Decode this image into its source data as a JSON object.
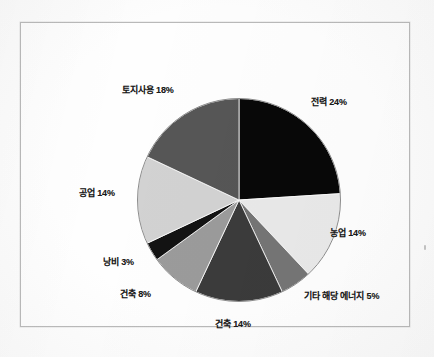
{
  "figure": {
    "frame_border_color": "#b9b9b9",
    "background_color": "#fdfdfd"
  },
  "chart_data": {
    "type": "pie",
    "title": "",
    "subtitle": "",
    "xlabel": "",
    "ylabel": "",
    "legend_position": "none",
    "grid": false,
    "label_format": "{name} {value}%",
    "start_angle_deg": 0,
    "direction": "clockwise",
    "total": 100,
    "categories": [
      "전력",
      "농업",
      "기타 해당 에너지",
      "건축",
      "건축",
      "낭비",
      "공업",
      "토지사용"
    ],
    "values": [
      24,
      14,
      5,
      14,
      8,
      3,
      14,
      18
    ],
    "colors": [
      "#080808",
      "#e9e9e9",
      "#757575",
      "#3b3b3b",
      "#9b9b9b",
      "#131313",
      "#d2d2d2",
      "#565656"
    ],
    "slices": [
      {
        "name": "전력",
        "value": 24,
        "label": "전력 24%",
        "color": "#080808"
      },
      {
        "name": "농업",
        "value": 14,
        "label": "농업 14%",
        "color": "#e9e9e9"
      },
      {
        "name": "기타 해당 에너지",
        "value": 5,
        "label": "기타 해당 에너지 5%",
        "color": "#757575"
      },
      {
        "name": "건축",
        "value": 14,
        "label": "건축 14%",
        "color": "#3b3b3b"
      },
      {
        "name": "건축",
        "value": 8,
        "label": "건축 8%",
        "color": "#9b9b9b"
      },
      {
        "name": "낭비",
        "value": 3,
        "label": "낭비 3%",
        "color": "#131313"
      },
      {
        "name": "공업",
        "value": 14,
        "label": "공업 14%",
        "color": "#d2d2d2"
      },
      {
        "name": "토지사용",
        "value": 18,
        "label": "토지사용 18%",
        "color": "#565656"
      }
    ]
  },
  "labels": {
    "power": "전력 24%",
    "agriculture": "농업 14%",
    "other_energy": "기타 해당 에너지 5%",
    "building_14": "건축 14%",
    "building_8": "건축 8%",
    "waste": "낭비 3%",
    "industry": "공업 14%",
    "land_use": "토지사용 18%"
  }
}
